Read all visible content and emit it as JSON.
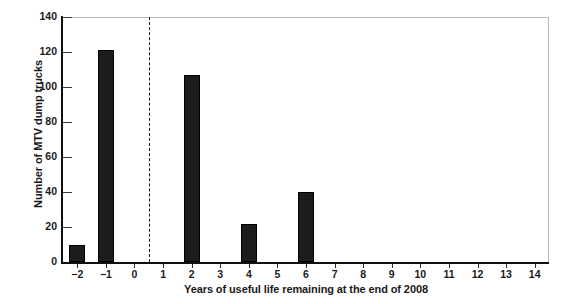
{
  "chart_data": {
    "type": "bar",
    "title": "",
    "subtitle": "",
    "xlabel": "Years of useful life remaining at the end of 2008",
    "ylabel": "Number of MTV dump trucks",
    "categories": [
      "-2",
      "-1",
      "0",
      "1",
      "2",
      "3",
      "4",
      "5",
      "6",
      "7",
      "8",
      "9",
      "10",
      "11",
      "12",
      "13",
      "14"
    ],
    "x_values": [
      -2,
      -1,
      0,
      1,
      2,
      3,
      4,
      5,
      6,
      7,
      8,
      9,
      10,
      11,
      12,
      13,
      14
    ],
    "values": [
      10,
      121,
      0,
      0,
      107,
      0,
      22,
      0,
      40,
      0,
      0,
      0,
      0,
      0,
      0,
      0,
      0
    ],
    "xlim": [
      -2.5,
      14.5
    ],
    "ylim": [
      0,
      140
    ],
    "y_ticks": [
      0,
      20,
      40,
      60,
      80,
      100,
      120,
      140
    ],
    "y_tick_labels": [
      "0",
      "20",
      "40",
      "60",
      "80",
      "100",
      "120",
      "140"
    ],
    "grid": false,
    "legend": "none",
    "bar_color": "#1c1c1c",
    "annotations": [
      {
        "name": "divider-line",
        "type": "vertical-dashed-line",
        "x": 0.5,
        "style": "dashed",
        "color": "#111111"
      }
    ]
  },
  "axes": {
    "y_title": "Number of MTV dump trucks",
    "x_title": "Years of useful life remaining at the end of 2008"
  },
  "colors": {
    "bar": "#1c1c1c",
    "axis": "#101010",
    "frame": "#b9b9b9",
    "text": "#1a1a1a",
    "divider": "#111111",
    "background": "#ffffff"
  }
}
